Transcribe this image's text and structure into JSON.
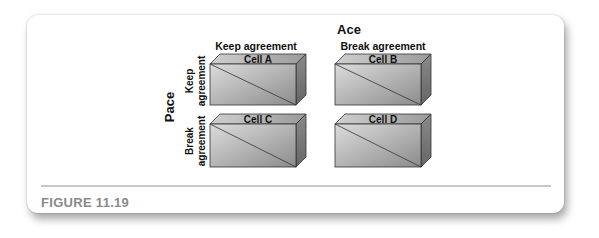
{
  "figure": {
    "column_player": "Ace",
    "row_player": "Pace",
    "column_labels": [
      "Keep agreement",
      "Break agreement"
    ],
    "row_labels": [
      {
        "line1": "Keep",
        "line2": "agreement"
      },
      {
        "line1": "Break",
        "line2": "agreement"
      }
    ],
    "cells": [
      {
        "label": "Cell A"
      },
      {
        "label": "Cell B"
      },
      {
        "label": "Cell C"
      },
      {
        "label": "Cell D"
      }
    ],
    "caption": "FIGURE 11.19"
  },
  "colors": {
    "box_front_light": "#d9d9d9",
    "box_front_dark": "#8f8f8f",
    "box_top": "#b8b8b8",
    "box_side": "#7a7a7a",
    "caption": "#8a8a8a",
    "divider": "#c8c8c8"
  }
}
